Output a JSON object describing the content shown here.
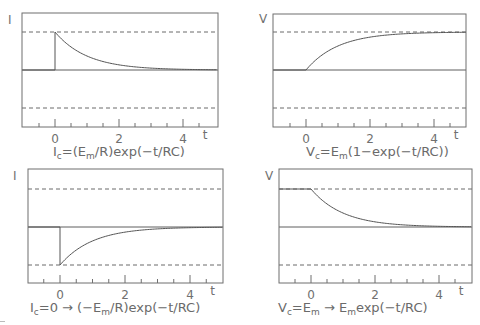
{
  "chart_data": [
    {
      "type": "line",
      "panel": "top-left",
      "title": "",
      "ylabel": "I",
      "xlabel": "t",
      "xlim": [
        -1,
        5
      ],
      "ylim": [
        -1.5,
        1.5
      ],
      "xtick_labels": [
        "0",
        "2",
        "4"
      ],
      "xticks_major": [
        0,
        2,
        4
      ],
      "xticks_minor": [
        -0.5,
        0.5,
        1,
        1.5,
        2.5,
        3,
        3.5,
        4.5
      ],
      "reference_lines": {
        "solid": [
          0
        ],
        "dashed": [
          1,
          -1
        ]
      },
      "grid": false,
      "caption_text": "I_c=(E_m/R)exp(−t/RC)",
      "caption": [
        {
          "text": "I"
        },
        {
          "sub": "c"
        },
        {
          "text": "=(E"
        },
        {
          "sub": "m"
        },
        {
          "text": "/R)exp(−t/RC)"
        }
      ],
      "series": [
        {
          "name": "I_c",
          "pre_value": 0,
          "t0_value": 1,
          "asymptote": 0,
          "tau": 1,
          "points": [
            [
              -1,
              0
            ],
            [
              0,
              0
            ],
            [
              0,
              1
            ],
            [
              0.5,
              0.61
            ],
            [
              1,
              0.37
            ],
            [
              1.5,
              0.22
            ],
            [
              2,
              0.14
            ],
            [
              2.5,
              0.08
            ],
            [
              3,
              0.05
            ],
            [
              3.5,
              0.03
            ],
            [
              4,
              0.02
            ],
            [
              4.5,
              0.01
            ],
            [
              5,
              0.01
            ]
          ]
        }
      ]
    },
    {
      "type": "line",
      "panel": "top-right",
      "title": "",
      "ylabel": "V",
      "xlabel": "t",
      "xlim": [
        -1,
        5
      ],
      "ylim": [
        -1.5,
        1.5
      ],
      "xtick_labels": [
        "0",
        "2",
        "4"
      ],
      "xticks_major": [
        0,
        2,
        4
      ],
      "xticks_minor": [
        -0.5,
        0.5,
        1,
        1.5,
        2.5,
        3,
        3.5,
        4.5
      ],
      "reference_lines": {
        "solid": [
          0
        ],
        "dashed": [
          1,
          -1
        ]
      },
      "grid": false,
      "caption_text": "V_c=E_m(1−exp(−t/RC))",
      "caption": [
        {
          "text": "V"
        },
        {
          "sub": "c"
        },
        {
          "text": "=E"
        },
        {
          "sub": "m"
        },
        {
          "text": "(1−exp(−t/RC))"
        }
      ],
      "series": [
        {
          "name": "V_c",
          "pre_value": 0,
          "t0_value": 0,
          "asymptote": 1,
          "tau": 1,
          "points": [
            [
              -1,
              0
            ],
            [
              0,
              0
            ],
            [
              0.5,
              0.39
            ],
            [
              1,
              0.63
            ],
            [
              1.5,
              0.78
            ],
            [
              2,
              0.86
            ],
            [
              2.5,
              0.92
            ],
            [
              3,
              0.95
            ],
            [
              3.5,
              0.97
            ],
            [
              4,
              0.98
            ],
            [
              4.5,
              0.99
            ],
            [
              5,
              0.99
            ]
          ]
        }
      ]
    },
    {
      "type": "line",
      "panel": "bottom-left",
      "title": "",
      "ylabel": "I",
      "xlabel": "t",
      "xlim": [
        -1,
        5
      ],
      "ylim": [
        -1.5,
        1.5
      ],
      "xtick_labels": [
        "0",
        "2",
        "4"
      ],
      "xticks_major": [
        0,
        2,
        4
      ],
      "xticks_minor": [
        -0.5,
        0.5,
        1,
        1.5,
        2.5,
        3,
        3.5,
        4.5
      ],
      "reference_lines": {
        "solid": [
          0
        ],
        "dashed": [
          1,
          -1
        ]
      },
      "grid": false,
      "caption_text": "I_c=0 → (−E_m/R)exp(−t/RC)",
      "caption": [
        {
          "text": "I"
        },
        {
          "sub": "c"
        },
        {
          "text": "=0 → (−E"
        },
        {
          "sub": "m"
        },
        {
          "text": "/R)exp(−t/RC)"
        }
      ],
      "series": [
        {
          "name": "I_c",
          "pre_value": 0,
          "t0_value": -1,
          "asymptote": 0,
          "tau": 1,
          "points": [
            [
              -1,
              0
            ],
            [
              0,
              0
            ],
            [
              0,
              -1
            ],
            [
              0.5,
              -0.61
            ],
            [
              1,
              -0.37
            ],
            [
              1.5,
              -0.22
            ],
            [
              2,
              -0.14
            ],
            [
              2.5,
              -0.08
            ],
            [
              3,
              -0.05
            ],
            [
              3.5,
              -0.03
            ],
            [
              4,
              -0.02
            ],
            [
              4.5,
              -0.01
            ],
            [
              5,
              -0.01
            ]
          ]
        }
      ]
    },
    {
      "type": "line",
      "panel": "bottom-right",
      "title": "",
      "ylabel": "V",
      "xlabel": "t",
      "xlim": [
        -1,
        5
      ],
      "ylim": [
        -1.5,
        1.5
      ],
      "xtick_labels": [
        "0",
        "2",
        "4"
      ],
      "xticks_major": [
        0,
        2,
        4
      ],
      "xticks_minor": [
        -0.5,
        0.5,
        1,
        1.5,
        2.5,
        3,
        3.5,
        4.5
      ],
      "reference_lines": {
        "solid": [
          0
        ],
        "dashed": [
          1,
          -1
        ]
      },
      "grid": false,
      "caption_text": "V_c=E_m → E_m exp(−t/RC)",
      "caption": [
        {
          "text": "V"
        },
        {
          "sub": "c"
        },
        {
          "text": "=E"
        },
        {
          "sub": "m"
        },
        {
          "text": " → E"
        },
        {
          "sub": "m"
        },
        {
          "text": "exp(−t/RC)"
        }
      ],
      "series": [
        {
          "name": "V_c",
          "pre_value": 1,
          "t0_value": 1,
          "asymptote": 0,
          "tau": 1,
          "points": [
            [
              -1,
              1
            ],
            [
              0,
              1
            ],
            [
              0.5,
              0.61
            ],
            [
              1,
              0.37
            ],
            [
              1.5,
              0.22
            ],
            [
              2,
              0.14
            ],
            [
              2.5,
              0.08
            ],
            [
              3,
              0.05
            ],
            [
              3.5,
              0.03
            ],
            [
              4,
              0.02
            ],
            [
              4.5,
              0.01
            ],
            [
              5,
              0.01
            ]
          ]
        }
      ]
    }
  ]
}
